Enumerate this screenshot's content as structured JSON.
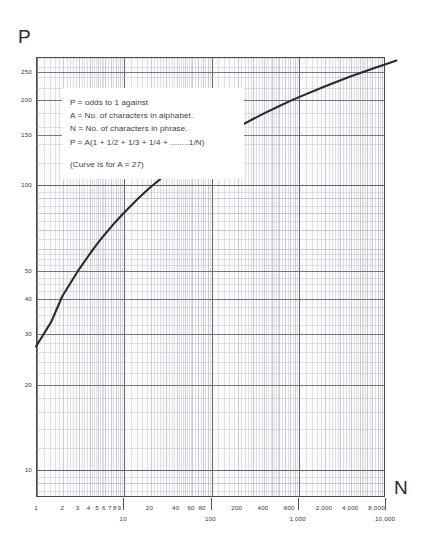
{
  "axes": {
    "y_name": "P",
    "x_name": "N"
  },
  "annotation": {
    "lines": [
      "P = odds to 1 against",
      "A = No. of characters in alphabet.",
      "N = No. of characters in phrase.",
      "P = A(1 + 1/2 + 1/3 + 1/4 + ........1/N)"
    ],
    "note": "(Curve is for A = 27)"
  },
  "chart_data": {
    "type": "line",
    "title": "",
    "xlabel": "N",
    "ylabel": "P",
    "xscale": "log",
    "yscale": "log",
    "xlim": [
      1,
      10000
    ],
    "ylim": [
      8,
      280
    ],
    "grid": true,
    "legend": null,
    "xticks": [
      {
        "value": 1,
        "label": "1",
        "row": 0
      },
      {
        "value": 2,
        "label": "2",
        "row": 0
      },
      {
        "value": 3,
        "label": "3",
        "row": 0
      },
      {
        "value": 4,
        "label": "4",
        "row": 0
      },
      {
        "value": 5,
        "label": "5",
        "row": 0
      },
      {
        "value": 6,
        "label": "6",
        "row": 0
      },
      {
        "value": 7,
        "label": "7",
        "row": 0
      },
      {
        "value": 8,
        "label": "8",
        "row": 0
      },
      {
        "value": 9,
        "label": "9",
        "row": 0
      },
      {
        "value": 10,
        "label": "10",
        "row": 1
      },
      {
        "value": 20,
        "label": "20",
        "row": 0
      },
      {
        "value": 40,
        "label": "40",
        "row": 0
      },
      {
        "value": 60,
        "label": "60",
        "row": 0
      },
      {
        "value": 80,
        "label": "80",
        "row": 0
      },
      {
        "value": 100,
        "label": "100",
        "row": 1
      },
      {
        "value": 200,
        "label": "200",
        "row": 0
      },
      {
        "value": 400,
        "label": "400",
        "row": 0
      },
      {
        "value": 800,
        "label": "800",
        "row": 0
      },
      {
        "value": 1000,
        "label": "1,000",
        "row": 1
      },
      {
        "value": 2000,
        "label": "2,000",
        "row": 0
      },
      {
        "value": 4000,
        "label": "4,000",
        "row": 0
      },
      {
        "value": 8000,
        "label": "8,000",
        "row": 0
      },
      {
        "value": 10000,
        "label": "10,000",
        "row": 1
      }
    ],
    "yticks": [
      {
        "value": 10,
        "label": "10"
      },
      {
        "value": 20,
        "label": "20"
      },
      {
        "value": 30,
        "label": "30"
      },
      {
        "value": 40,
        "label": "40"
      },
      {
        "value": 50,
        "label": "50"
      },
      {
        "value": 100,
        "label": "100"
      },
      {
        "value": 150,
        "label": "150"
      },
      {
        "value": 200,
        "label": "200"
      },
      {
        "value": 250,
        "label": "250"
      }
    ],
    "series": [
      {
        "name": "P = A(1 + 1/2 + ... + 1/N), A = 27",
        "color": "#2a2a2a",
        "points": [
          {
            "x": 1,
            "y": 27
          },
          {
            "x": 1.5,
            "y": 33
          },
          {
            "x": 2,
            "y": 40.5
          },
          {
            "x": 3,
            "y": 49.5
          },
          {
            "x": 4,
            "y": 56.2
          },
          {
            "x": 5,
            "y": 61.7
          },
          {
            "x": 6,
            "y": 66.2
          },
          {
            "x": 8,
            "y": 73.4
          },
          {
            "x": 10,
            "y": 79.1
          },
          {
            "x": 15,
            "y": 89.6
          },
          {
            "x": 20,
            "y": 97.1
          },
          {
            "x": 30,
            "y": 107.7
          },
          {
            "x": 40,
            "y": 115.3
          },
          {
            "x": 60,
            "y": 126.0
          },
          {
            "x": 80,
            "y": 133.6
          },
          {
            "x": 100,
            "y": 139.6
          },
          {
            "x": 150,
            "y": 150.5
          },
          {
            "x": 200,
            "y": 158.2
          },
          {
            "x": 400,
            "y": 176.9
          },
          {
            "x": 600,
            "y": 187.8
          },
          {
            "x": 800,
            "y": 195.6
          },
          {
            "x": 1000,
            "y": 201.6
          },
          {
            "x": 2000,
            "y": 220.3
          },
          {
            "x": 4000,
            "y": 239.0
          },
          {
            "x": 8000,
            "y": 257.7
          },
          {
            "x": 10000,
            "y": 263.7
          },
          {
            "x": 13500,
            "y": 272.0
          }
        ]
      }
    ]
  }
}
